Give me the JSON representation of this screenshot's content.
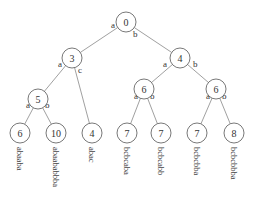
{
  "diagram": {
    "type": "tree",
    "nodes": [
      {
        "id": "n0",
        "label": "0",
        "x": 126,
        "y": 22
      },
      {
        "id": "n3",
        "label": "3",
        "x": 72,
        "y": 58
      },
      {
        "id": "n4",
        "label": "4",
        "x": 180,
        "y": 58
      },
      {
        "id": "n5",
        "label": "5",
        "x": 38,
        "y": 99
      },
      {
        "id": "n6a",
        "label": "6",
        "x": 144,
        "y": 89
      },
      {
        "id": "n6b",
        "label": "6",
        "x": 216,
        "y": 89
      },
      {
        "id": "l1",
        "label": "6",
        "x": 20,
        "y": 133,
        "text": "abaaba"
      },
      {
        "id": "l2",
        "label": "10",
        "x": 56,
        "y": 133,
        "text": "abaababbba"
      },
      {
        "id": "l3",
        "label": "4",
        "x": 92,
        "y": 133,
        "text": "abac"
      },
      {
        "id": "l4",
        "label": "7",
        "x": 127,
        "y": 133,
        "text": "bcbcaba"
      },
      {
        "id": "l5",
        "label": "7",
        "x": 161,
        "y": 133,
        "text": "bcbcabb"
      },
      {
        "id": "l6",
        "label": "7",
        "x": 197,
        "y": 133,
        "text": "bcbcbba"
      },
      {
        "id": "l7",
        "label": "8",
        "x": 234,
        "y": 133,
        "text": "bcbcbbba"
      }
    ],
    "edges": [
      {
        "from": "n0",
        "to": "n3",
        "label": "a",
        "lx": 111,
        "ly": 28
      },
      {
        "from": "n0",
        "to": "n4",
        "label": "b",
        "lx": 133,
        "ly": 37
      },
      {
        "from": "n3",
        "to": "n5",
        "label": "a",
        "lx": 58,
        "ly": 67
      },
      {
        "from": "n3",
        "to": "l3",
        "label": "c",
        "lx": 78,
        "ly": 73
      },
      {
        "from": "n4",
        "to": "n6a",
        "label": "a",
        "lx": 163,
        "ly": 67
      },
      {
        "from": "n4",
        "to": "n6b",
        "label": "b",
        "lx": 193,
        "ly": 67
      },
      {
        "from": "n5",
        "to": "l1",
        "label": "a",
        "lx": 26,
        "ly": 108
      },
      {
        "from": "n5",
        "to": "l2",
        "label": "b",
        "lx": 45,
        "ly": 108
      },
      {
        "from": "n6a",
        "to": "l4",
        "label": "a",
        "lx": 134,
        "ly": 99
      },
      {
        "from": "n6a",
        "to": "l5",
        "label": "b",
        "lx": 150,
        "ly": 99
      },
      {
        "from": "n6b",
        "to": "l6",
        "label": "a",
        "lx": 206,
        "ly": 99
      },
      {
        "from": "n6b",
        "to": "l7",
        "label": "b",
        "lx": 222,
        "ly": 99
      }
    ]
  }
}
